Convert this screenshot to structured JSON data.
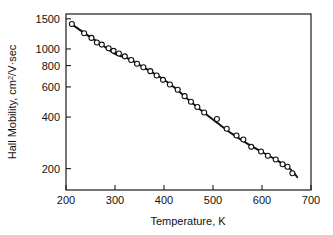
{
  "chart_data": {
    "type": "scatter",
    "title": "",
    "subtitle": "",
    "xlabel": "Temperature, K",
    "ylabel": "Hall Mobility, cm2/V·sec",
    "ylabel_parts": {
      "before": "Hall Mobility, cm",
      "superscript": "2",
      "after": "/V·sec"
    },
    "xscale": "linear",
    "yscale": "log",
    "xlim": [
      200,
      700
    ],
    "ylim": [
      150,
      1600
    ],
    "grid": false,
    "legend": null,
    "xticks": [
      200,
      300,
      400,
      500,
      600,
      700
    ],
    "xticklabels": [
      "200",
      "300",
      "400",
      "500",
      "600",
      "700"
    ],
    "yticks": [
      200,
      400,
      600,
      800,
      1000,
      1500
    ],
    "yticklabels": [
      "200",
      "400",
      "600",
      "800",
      "1000",
      "1500"
    ],
    "marker": "open-circle",
    "series": [
      {
        "name": "Hall mobility",
        "x": [
          212,
          237,
          252,
          263,
          273,
          287,
          297,
          308,
          320,
          333,
          345,
          358,
          372,
          385,
          398,
          412,
          428,
          442,
          455,
          468,
          482,
          508,
          528,
          548,
          562,
          578,
          598,
          612,
          628,
          642,
          652,
          662
        ],
        "y": [
          1400,
          1235,
          1160,
          1090,
          1060,
          1010,
          975,
          940,
          905,
          862,
          820,
          782,
          742,
          700,
          660,
          620,
          578,
          530,
          492,
          458,
          425,
          390,
          342,
          312,
          296,
          268,
          252,
          238,
          226,
          212,
          205,
          188
        ]
      }
    ],
    "fit_curve": {
      "name": "smooth fit",
      "x": [
        210,
        240,
        270,
        300,
        330,
        360,
        390,
        420,
        450,
        480,
        510,
        540,
        570,
        600,
        630,
        660,
        672
      ],
      "y": [
        1405,
        1225,
        1075,
        935,
        872,
        775,
        690,
        600,
        505,
        428,
        368,
        318,
        280,
        250,
        224,
        196,
        178
      ]
    },
    "axis_ticks_direction": "inward",
    "frame": "full-box"
  }
}
